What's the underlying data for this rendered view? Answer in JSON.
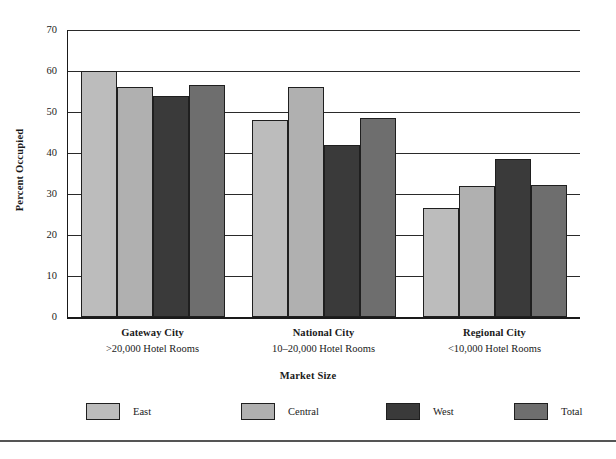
{
  "chart_data": {
    "type": "bar",
    "title": "",
    "xlabel": "Market Size",
    "ylabel": "Percent Occupied",
    "ylim": [
      0,
      70
    ],
    "yticks": [
      0,
      10,
      20,
      30,
      40,
      50,
      60,
      70
    ],
    "grid": true,
    "legend_position": "bottom",
    "categories": [
      "Gateway City",
      "National City",
      "Regional City"
    ],
    "category_sublabels": [
      ">20,000 Hotel Rooms",
      "10–20,000 Hotel Rooms",
      "<10,000 Hotel Rooms"
    ],
    "series": [
      {
        "name": "East",
        "color": "#bcbcbc",
        "values": [
          60.0,
          48.0,
          26.5
        ]
      },
      {
        "name": "Central",
        "color": "#b0b0b0",
        "values": [
          56.0,
          56.0,
          32.0
        ]
      },
      {
        "name": "West",
        "color": "#3a3a3a",
        "values": [
          54.0,
          42.0,
          38.5
        ]
      },
      {
        "name": "Total",
        "color": "#6e6e6e",
        "values": [
          56.5,
          48.5,
          32.2
        ]
      }
    ]
  },
  "axes": {
    "y_title": "Percent Occupied",
    "x_title": "Market Size",
    "y_tick_labels": [
      "0",
      "10",
      "20",
      "30",
      "40",
      "50",
      "60",
      "70"
    ]
  },
  "legend": {
    "items": [
      {
        "label": "East"
      },
      {
        "label": "Central"
      },
      {
        "label": "West"
      },
      {
        "label": "Total"
      }
    ]
  }
}
